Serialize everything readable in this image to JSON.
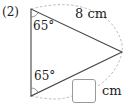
{
  "problem": {
    "number_label": "(2)"
  },
  "triangle": {
    "vertices": {
      "top": [
        31,
        9
      ],
      "bottom": [
        31,
        96
      ],
      "right": [
        122,
        52
      ]
    },
    "angles": {
      "top": "65°",
      "bottom": "65°"
    },
    "sides": {
      "top_to_right": "8 cm",
      "bottom_to_right": "unknown (answer box)"
    }
  },
  "answer": {
    "box_value": "",
    "unit": "cm"
  },
  "labels": {
    "side_length": "8 cm",
    "angle_top": "65°",
    "angle_bottom": "65°",
    "unit": "cm"
  },
  "colors": {
    "line": "#444444",
    "dashed": "#b0b0b0",
    "text": "#222222",
    "box_border": "#9a9a9a"
  }
}
